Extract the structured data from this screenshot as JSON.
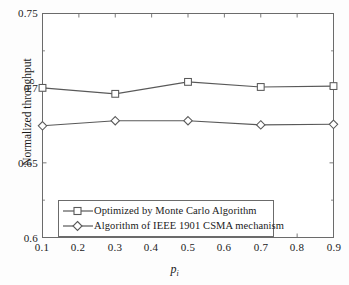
{
  "chart_data": {
    "type": "line",
    "title": "",
    "xlabel": "p_i",
    "xlabel_base": "p",
    "xlabel_sub": "i",
    "ylabel": "Normalized throughput",
    "x": [
      0.1,
      0.2,
      0.3,
      0.4,
      0.5,
      0.6,
      0.7,
      0.8,
      0.9
    ],
    "xlim": [
      0.1,
      0.9
    ],
    "ylim": [
      0.6,
      0.75
    ],
    "xticks": [
      "0.1",
      "0.2",
      "0.3",
      "0.4",
      "0.5",
      "0.6",
      "0.7",
      "0.8",
      "0.9"
    ],
    "yticks": [
      "0.6",
      "0.65",
      "0.7",
      "0.75"
    ],
    "grid": false,
    "legend_position": "lower-center",
    "series": [
      {
        "name": "Optimized by Monte Carlo Algorithm",
        "marker": "square",
        "color": "#595959",
        "x": [
          0.1,
          0.3,
          0.5,
          0.7,
          0.9
        ],
        "values": [
          0.7002,
          0.6962,
          0.7042,
          0.7008,
          0.7014
        ]
      },
      {
        "name": "Algorithm of IEEE 1901 CSMA mechanism",
        "marker": "diamond",
        "color": "#595959",
        "x": [
          0.1,
          0.3,
          0.5,
          0.7,
          0.9
        ],
        "values": [
          0.6748,
          0.6782,
          0.6782,
          0.6754,
          0.6758
        ]
      }
    ]
  },
  "axes": {
    "y_ticks": [
      {
        "label": "0.75",
        "value": 0.75
      },
      {
        "label": "0.7",
        "value": 0.7
      },
      {
        "label": "0.65",
        "value": 0.65
      },
      {
        "label": "0.6",
        "value": 0.6
      }
    ],
    "x_ticks": [
      {
        "label": "0.1",
        "value": 0.1
      },
      {
        "label": "0.2",
        "value": 0.2
      },
      {
        "label": "0.3",
        "value": 0.3
      },
      {
        "label": "0.4",
        "value": 0.4
      },
      {
        "label": "0.5",
        "value": 0.5
      },
      {
        "label": "0.6",
        "value": 0.6
      },
      {
        "label": "0.7",
        "value": 0.7
      },
      {
        "label": "0.8",
        "value": 0.8
      },
      {
        "label": "0.9",
        "value": 0.9
      }
    ],
    "y_axis_label": "Normalized throughput",
    "x_axis_label_base": "p",
    "x_axis_label_sub": "i"
  },
  "legend": {
    "items": [
      {
        "label": "Optimized by Monte Carlo Algorithm",
        "marker": "square"
      },
      {
        "label": "Algorithm of IEEE 1901 CSMA mechanism",
        "marker": "diamond"
      }
    ]
  },
  "colors": {
    "line": "#595959",
    "axis": "#6b6b6b",
    "text": "#1a1a1a",
    "background": "#ffffff"
  }
}
